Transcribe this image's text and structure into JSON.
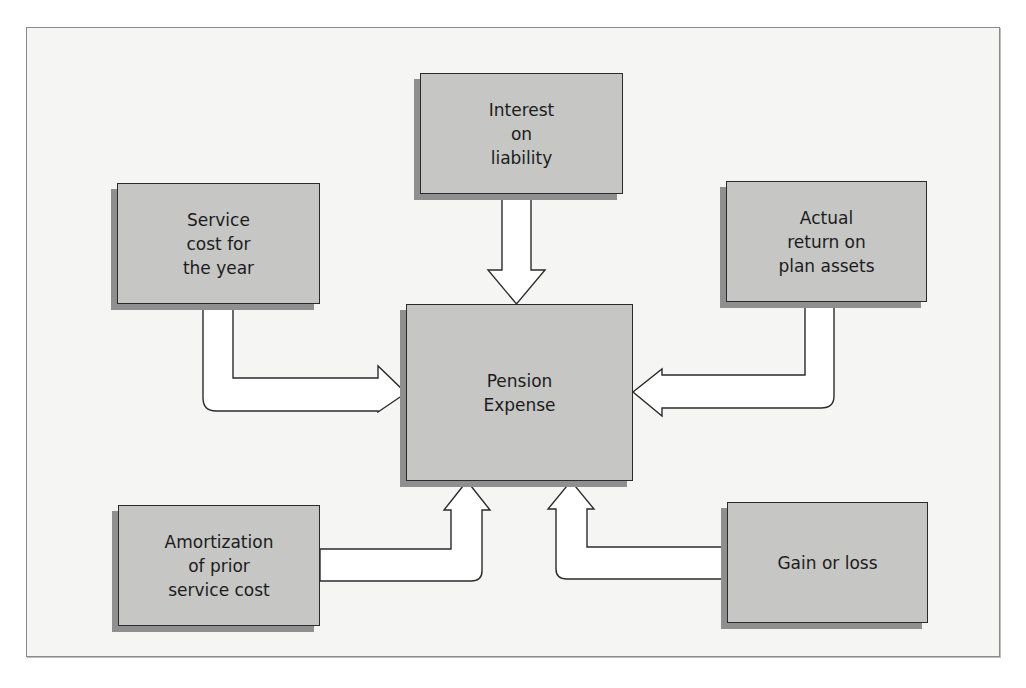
{
  "diagram": {
    "center": {
      "label": "Pension\nExpense"
    },
    "components": [
      {
        "id": "interest",
        "label": "Interest\non\nliability",
        "position": "top",
        "arrow_direction": "down"
      },
      {
        "id": "service",
        "label": "Service\ncost for\nthe year",
        "position": "top-left",
        "arrow_direction": "right"
      },
      {
        "id": "actual",
        "label": "Actual\nreturn on\nplan assets",
        "position": "top-right",
        "arrow_direction": "left"
      },
      {
        "id": "amort",
        "label": "Amortization\nof prior\nservice cost",
        "position": "bottom-left",
        "arrow_direction": "up"
      },
      {
        "id": "gain",
        "label": "Gain or loss",
        "position": "bottom-right",
        "arrow_direction": "up"
      }
    ],
    "colors": {
      "box_fill": "#c6c6c5",
      "box_border": "#2b2b2b",
      "box_shadow": "#8f8f8f",
      "arrow_fill": "#ffffff",
      "background": "#f5f5f4"
    }
  }
}
